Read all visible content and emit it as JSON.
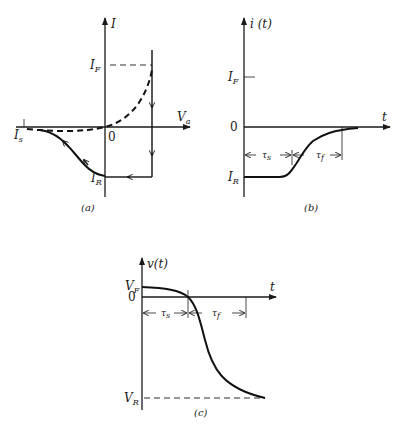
{
  "figure": {
    "panel_a": {
      "caption": "(a)",
      "y_axis_label": "I",
      "x_axis_label": "V",
      "x_axis_sub": "a",
      "origin_label": "0",
      "forward_current_label": "I",
      "forward_current_sub": "F",
      "reverse_current_label": "I",
      "reverse_current_sub": "R",
      "saturation_label": "I",
      "saturation_sub": "s"
    },
    "panel_b": {
      "caption": "(b)",
      "y_axis_label": "i (t)",
      "x_axis_label": "t",
      "origin_label": "0",
      "forward_current_label": "I",
      "forward_current_sub": "F",
      "reverse_current_label": "I",
      "reverse_current_sub": "R",
      "storage_time_label": "τ",
      "storage_time_sub": "s",
      "fall_time_label": "τ",
      "fall_time_sub": "f"
    },
    "panel_c": {
      "caption": "(c)",
      "y_axis_label": "v(t)",
      "x_axis_label": "t",
      "origin_label": "0",
      "forward_voltage_label": "V",
      "forward_voltage_sub": "F",
      "reverse_voltage_label": "V",
      "reverse_voltage_sub": "R",
      "storage_time_label": "τ",
      "storage_time_sub": "s",
      "fall_time_label": "τ",
      "fall_time_sub": "f"
    }
  }
}
